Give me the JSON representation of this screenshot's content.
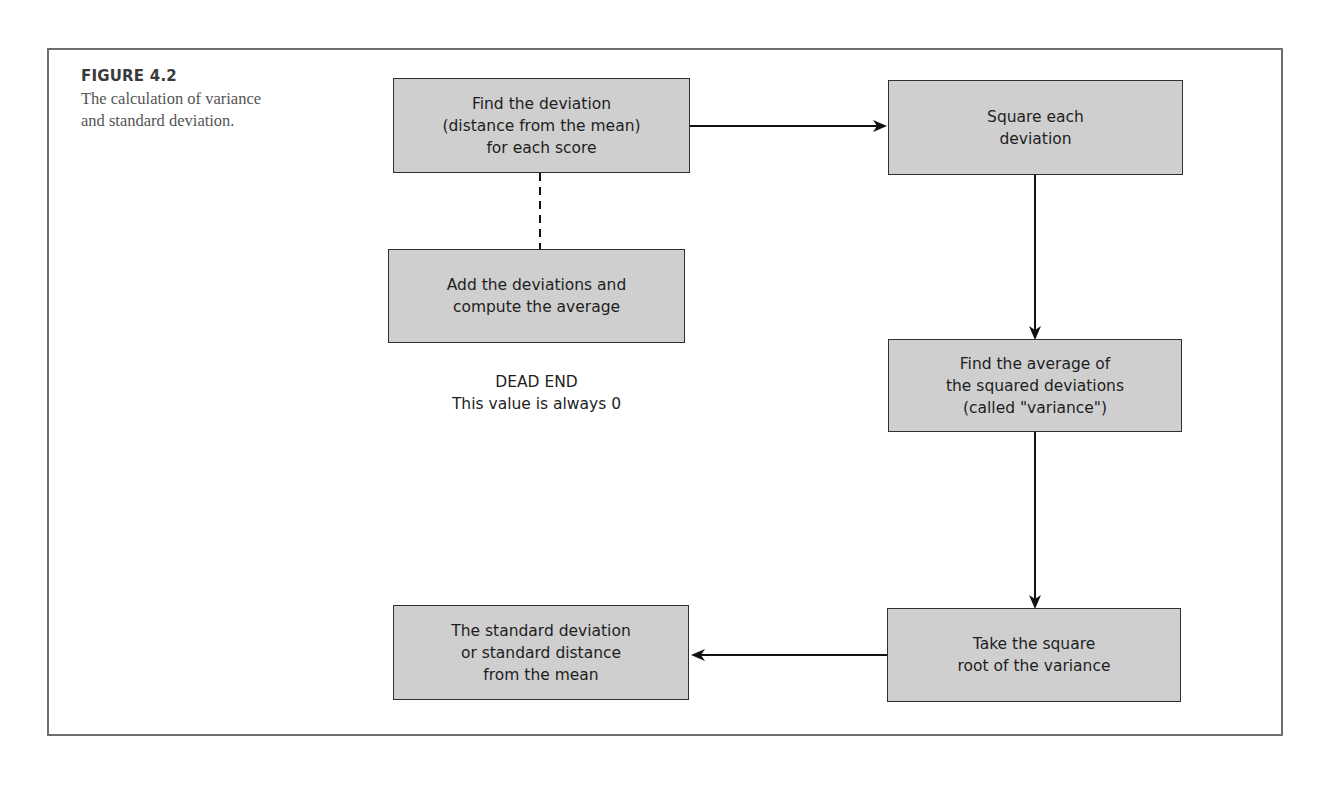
{
  "figure": {
    "label": "FIGURE 4.2",
    "caption": "The calculation of variance and standard deviation."
  },
  "flowchart": {
    "nodes": [
      {
        "id": "find-deviation",
        "text": "Find the deviation\n(distance from the mean)\nfor each score"
      },
      {
        "id": "add-deviations",
        "text": "Add the deviations and\ncompute the average"
      },
      {
        "id": "square-deviation",
        "text": "Square each\ndeviation"
      },
      {
        "id": "average-squared",
        "text": "Find the average of\nthe squared deviations\n(called \"variance\")"
      },
      {
        "id": "square-root",
        "text": "Take the square\nroot of the variance"
      },
      {
        "id": "standard-deviation",
        "text": "The standard deviation\nor standard distance\nfrom the mean"
      }
    ],
    "dead_end_note": "DEAD END\nThis value is always 0",
    "edges": [
      {
        "from": "find-deviation",
        "to": "square-deviation",
        "style": "solid-arrow"
      },
      {
        "from": "find-deviation",
        "to": "add-deviations",
        "style": "dashed"
      },
      {
        "from": "square-deviation",
        "to": "average-squared",
        "style": "solid-arrow"
      },
      {
        "from": "average-squared",
        "to": "square-root",
        "style": "solid-arrow"
      },
      {
        "from": "square-root",
        "to": "standard-deviation",
        "style": "solid-arrow"
      }
    ]
  },
  "colors": {
    "box_fill": "#cfcfcf",
    "box_border": "#2f2f2f",
    "frame_border": "#6f6f6f",
    "arrow": "#111111"
  }
}
